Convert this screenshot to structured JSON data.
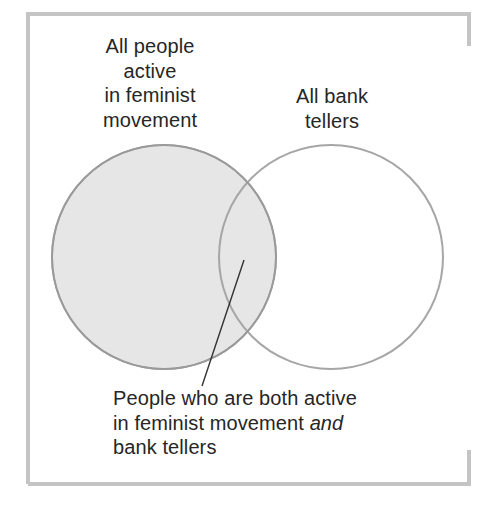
{
  "diagram": {
    "type": "venn",
    "frame": {
      "color": "#c4c4c4",
      "stroke_width": 4
    },
    "sets": [
      {
        "id": "feminist",
        "label_lines": [
          "All people",
          "active",
          "in feminist",
          "movement"
        ],
        "fill": "#e6e6e6",
        "stroke": "#9a9a9a"
      },
      {
        "id": "bank_tellers",
        "label_lines": [
          "All bank",
          "tellers"
        ],
        "fill": "none",
        "stroke": "#a6a6a6"
      }
    ],
    "intersection": {
      "label_line1": "People who are both active",
      "label_line2_prefix": "in feminist movement ",
      "label_line2_emphasis": "and",
      "label_line3": "bank tellers",
      "pointer_color": "#333333"
    }
  }
}
